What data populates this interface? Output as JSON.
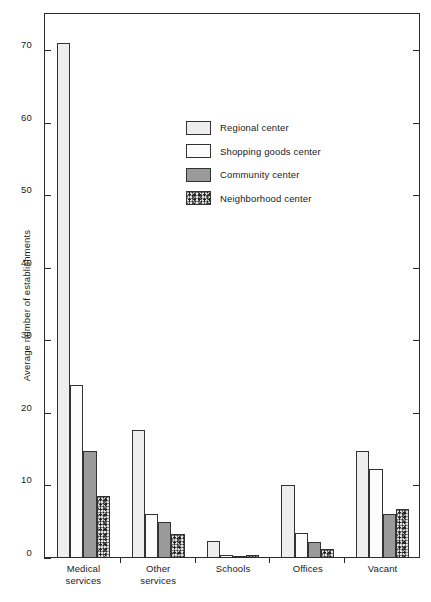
{
  "chart_data": {
    "type": "bar",
    "title": "",
    "xlabel": "",
    "ylabel": "Average number of establishments",
    "ylim": [
      0,
      75
    ],
    "yticks": [
      0,
      10,
      20,
      30,
      40,
      50,
      60,
      70
    ],
    "ytick_labels": [
      "0",
      "10",
      "20",
      "30",
      "40",
      "50",
      "60",
      "70"
    ],
    "grid": false,
    "legend_position": "upper center",
    "categories": [
      "Medical\nservices",
      "Other\nservices",
      "Schools",
      "Offices",
      "Vacant"
    ],
    "category_labels": [
      [
        "Medical",
        "services"
      ],
      [
        "Other",
        "services"
      ],
      [
        "Schools",
        ""
      ],
      [
        "Offices",
        ""
      ],
      [
        "Vacant",
        ""
      ]
    ],
    "series": [
      {
        "name": "Regional center",
        "fill": "light-solid",
        "values": [
          71.0,
          17.6,
          2.3,
          10.0,
          14.8
        ]
      },
      {
        "name": "Shopping goods center",
        "fill": "fine-dots",
        "values": [
          23.9,
          6.0,
          0.4,
          3.4,
          12.3
        ]
      },
      {
        "name": "Community center",
        "fill": "medium-gray",
        "values": [
          14.7,
          5.0,
          0.15,
          2.2,
          6.0
        ]
      },
      {
        "name": "Neighborhood center",
        "fill": "coarse-speckle",
        "values": [
          8.6,
          3.3,
          0.4,
          1.2,
          6.8
        ]
      }
    ]
  },
  "legend": {
    "items": [
      {
        "label": "Regional center"
      },
      {
        "label": "Shopping goods center"
      },
      {
        "label": "Community center"
      },
      {
        "label": "Neighborhood center"
      }
    ]
  },
  "colors": {
    "axis": "#2b2b2b",
    "bar_border": "#333333",
    "regional": "#eeeeee",
    "community": "#9a9a9a",
    "background": "#ffffff"
  }
}
